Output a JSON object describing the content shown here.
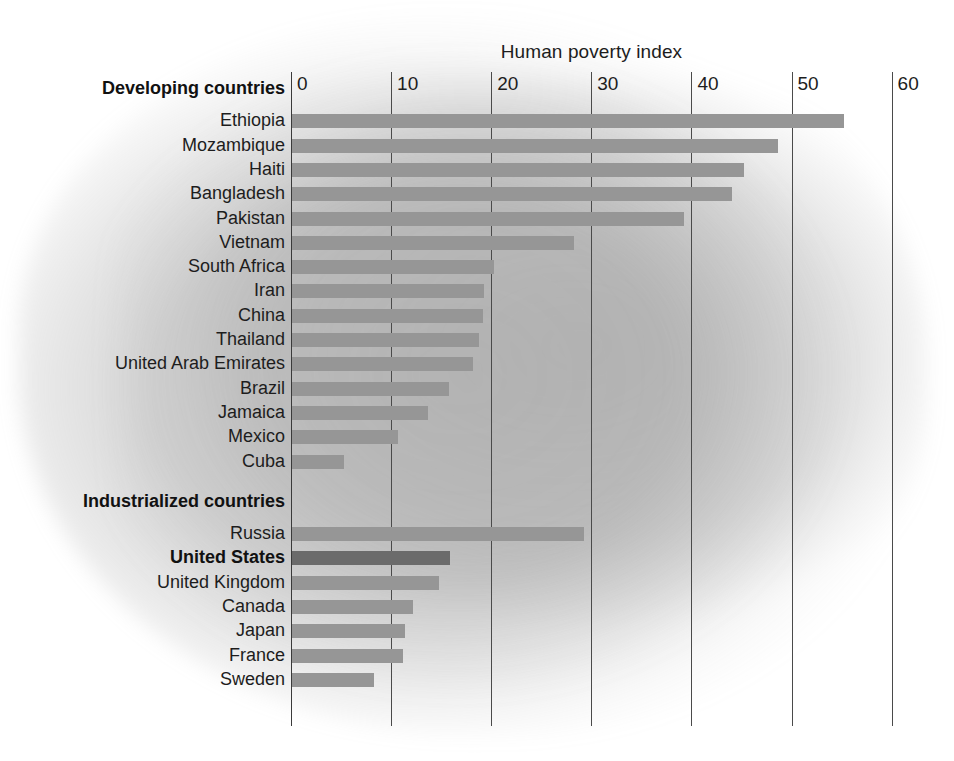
{
  "chart_data": {
    "type": "bar",
    "orientation": "horizontal",
    "title": "Human poverty index",
    "xlabel": "Human poverty index",
    "ylabel": "",
    "xlim": [
      0,
      60
    ],
    "xticks": [
      0,
      10,
      20,
      30,
      40,
      50,
      60
    ],
    "grid": true,
    "legend": "none",
    "groups": [
      {
        "name": "Developing countries",
        "categories": [
          "Ethiopia",
          "Mozambique",
          "Haiti",
          "Bangladesh",
          "Pakistan",
          "Vietnam",
          "South Africa",
          "Iran",
          "China",
          "Thailand",
          "United Arab Emirates",
          "Brazil",
          "Jamaica",
          "Mexico",
          "Cuba"
        ],
        "values": [
          55.1,
          48.6,
          45.2,
          44.0,
          39.2,
          28.2,
          20.2,
          19.2,
          19.1,
          18.7,
          18.1,
          15.7,
          13.6,
          10.6,
          5.2
        ]
      },
      {
        "name": "Industrialized countries",
        "categories": [
          "Russia",
          "United States",
          "United Kingdom",
          "Canada",
          "Japan",
          "France",
          "Sweden"
        ],
        "values": [
          29.2,
          15.8,
          14.7,
          12.1,
          11.3,
          11.1,
          8.2
        ],
        "highlight": "United States"
      }
    ]
  },
  "colors": {
    "bar": "#969696",
    "bar_highlight": "#6b6b6b",
    "axis": "#4a4a4a",
    "text": "#1d1d1d"
  },
  "axis": {
    "ticks": [
      {
        "label": "0"
      },
      {
        "label": "10"
      },
      {
        "label": "20"
      },
      {
        "label": "30"
      },
      {
        "label": "40"
      },
      {
        "label": "50"
      },
      {
        "label": "60"
      }
    ]
  },
  "headings": {
    "developing": "Developing countries",
    "industrialized": "Industrialized countries"
  }
}
